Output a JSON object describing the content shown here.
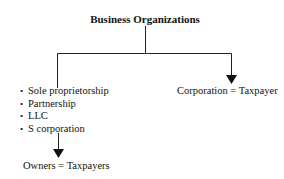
{
  "diagram": {
    "title": "Business Organizations",
    "left_branch": {
      "items": [
        {
          "label": "Sole proprietorship"
        },
        {
          "label": "Partnership"
        },
        {
          "label": "LLC"
        },
        {
          "label": "S corporation"
        }
      ],
      "result": "Owners = Taxpayers"
    },
    "right_branch": {
      "label": "Corporation = Taxpayer"
    },
    "colors": {
      "line": "#222222",
      "background": "#ffffff"
    }
  }
}
